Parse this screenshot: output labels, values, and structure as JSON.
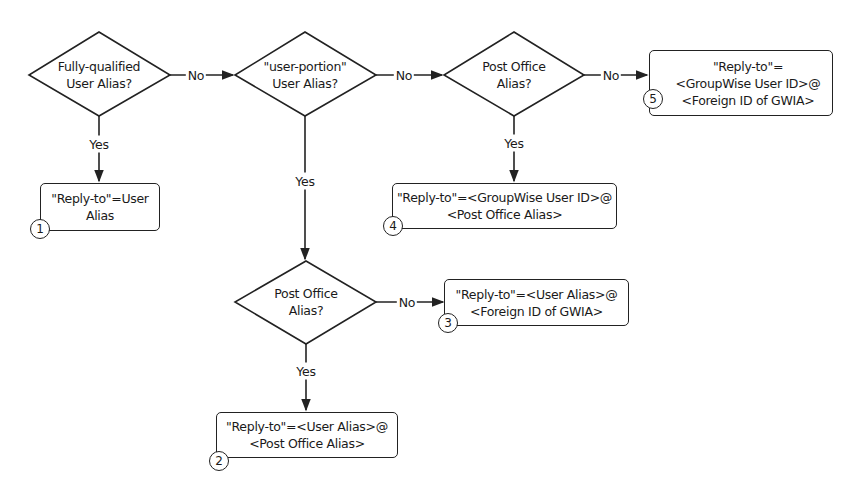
{
  "diagram": {
    "type": "flowchart",
    "decisions": [
      {
        "id": "d1",
        "label": "Fully-qualified\nUser Alias?"
      },
      {
        "id": "d2",
        "label": "\"user-portion\"\nUser Alias?"
      },
      {
        "id": "d3",
        "label": "Post Office\nAlias?"
      },
      {
        "id": "d4",
        "label": "Post Office\nAlias?"
      }
    ],
    "outcomes": [
      {
        "id": "o1",
        "number": "1",
        "label": "\"Reply-to\"=User\nAlias"
      },
      {
        "id": "o2",
        "number": "2",
        "label": "\"Reply-to\"=<User Alias>@\n<Post Office Alias>"
      },
      {
        "id": "o3",
        "number": "3",
        "label": "\"Reply-to\"=<User Alias>@\n<Foreign ID of GWIA>"
      },
      {
        "id": "o4",
        "number": "4",
        "label": "\"Reply-to\"=<GroupWise User ID>@\n<Post Office Alias>"
      },
      {
        "id": "o5",
        "number": "5",
        "label": "\"Reply-to\"=\n<GroupWise User ID>@\n<Foreign ID of GWIA>"
      }
    ],
    "edges": [
      {
        "from": "d1",
        "to": "d2",
        "label": "No"
      },
      {
        "from": "d1",
        "to": "o1",
        "label": "Yes"
      },
      {
        "from": "d2",
        "to": "d3",
        "label": "No"
      },
      {
        "from": "d2",
        "to": "d4",
        "label": "Yes"
      },
      {
        "from": "d3",
        "to": "o5",
        "label": "No"
      },
      {
        "from": "d3",
        "to": "o4",
        "label": "Yes"
      },
      {
        "from": "d4",
        "to": "o3",
        "label": "No"
      },
      {
        "from": "d4",
        "to": "o2",
        "label": "Yes"
      }
    ],
    "colors": {
      "stroke": "#222222",
      "text": "#1a1a1a",
      "background": "#ffffff"
    }
  }
}
